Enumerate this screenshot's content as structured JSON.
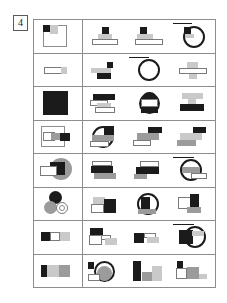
{
  "page": {
    "item_number": "4",
    "background_color": "#ffffff",
    "border_color": "#8d8d8d"
  },
  "palette": {
    "black": "#1b1b1b",
    "gray": "#9b9b9b",
    "light_gray": "#c9c9c9",
    "white": "#ffffff",
    "outline": "#7a7a7a"
  },
  "grid": {
    "rows": 8,
    "problem_column_count": 1,
    "option_column_count": 3,
    "rows_data": [
      {
        "index": 1,
        "problem": {
          "name": "large-outlined-square-with-black-and-gray-squares",
          "shapes": [
            "outline-square",
            "black-square",
            "light-gray-square"
          ]
        },
        "options": [
          {
            "index": 1,
            "name": "black-square-on-gray-trapezoid-on-white-bar",
            "shapes": [
              "black-square",
              "gray-trapezoid",
              "white-bar"
            ]
          },
          {
            "index": 2,
            "name": "black-square-on-gray-bar-over-white-bar",
            "shapes": [
              "black-square",
              "gray-bar",
              "white-bar"
            ]
          },
          {
            "index": 3,
            "name": "circle-with-black-square-and-horizontal-divider",
            "shapes": [
              "circle-outline",
              "black-square",
              "gray-bar",
              "horizontal-line"
            ]
          }
        ]
      },
      {
        "index": 2,
        "problem": {
          "name": "thin-white-bar-with-gray-end",
          "shapes": [
            "white-bar",
            "light-gray-square"
          ]
        },
        "options": [
          {
            "index": 1,
            "name": "gray-bar-with-black-square-over-black-bar",
            "shapes": [
              "gray-bar",
              "black-square",
              "black-bar"
            ]
          },
          {
            "index": 2,
            "name": "circle-with-horizontal-divider",
            "shapes": [
              "circle-outline",
              "horizontal-line"
            ]
          },
          {
            "index": 3,
            "name": "gray-cross-over-white-bar",
            "shapes": [
              "gray-bar",
              "white-bar",
              "gray-vertical-bar"
            ]
          }
        ]
      },
      {
        "index": 3,
        "problem": {
          "name": "solid-black-square",
          "shapes": [
            "black-square"
          ]
        },
        "options": [
          {
            "index": 1,
            "name": "black-bar-over-white-bars-staircase",
            "shapes": [
              "black-bar",
              "white-bar",
              "light-gray-bar",
              "white-bar"
            ]
          },
          {
            "index": 2,
            "name": "circle-with-black-cap-and-black-base",
            "shapes": [
              "circle-outline",
              "black-cap",
              "white-band",
              "black-base"
            ]
          },
          {
            "index": 3,
            "name": "light-gray-bar-over-black-bar-stack",
            "shapes": [
              "light-gray-bar",
              "gray-vertical-bar",
              "black-bar"
            ]
          }
        ]
      },
      {
        "index": 4,
        "problem": {
          "name": "overlapping-outline-gray-and-black-rectangles",
          "shapes": [
            "outline-square",
            "white-bar",
            "gray-bar",
            "black-bar"
          ]
        },
        "options": [
          {
            "index": 1,
            "name": "circle-with-black-corner-gray-band-and-white-bar",
            "shapes": [
              "circle-outline",
              "black-square",
              "gray-bar",
              "white-bar"
            ]
          },
          {
            "index": 2,
            "name": "black-gray-white-bar-staircase-right",
            "shapes": [
              "black-bar",
              "gray-bar",
              "white-bar"
            ]
          },
          {
            "index": 3,
            "name": "black-gray-white-bar-staircase-left",
            "shapes": [
              "black-bar",
              "light-gray-bar",
              "gray-bar"
            ]
          }
        ]
      },
      {
        "index": 5,
        "problem": {
          "name": "gray-circle-with-black-bar-and-white-rectangle",
          "shapes": [
            "gray-circle",
            "black-bar",
            "white-rectangle"
          ]
        },
        "options": [
          {
            "index": 1,
            "name": "white-bar-over-black-bar-over-gray-bar",
            "shapes": [
              "white-bar",
              "black-bar",
              "gray-bar"
            ]
          },
          {
            "index": 2,
            "name": "white-bar-over-black-bar-with-gray-step",
            "shapes": [
              "white-bar",
              "black-bar",
              "gray-bar"
            ]
          },
          {
            "index": 3,
            "name": "circle-with-gray-band-and-white-bar",
            "shapes": [
              "circle-outline",
              "gray-bar",
              "white-bar",
              "horizontal-line"
            ]
          }
        ]
      },
      {
        "index": 6,
        "problem": {
          "name": "three-overlapping-circles-black-gray-white",
          "shapes": [
            "black-circle",
            "gray-circle",
            "white-circle-outline"
          ]
        },
        "options": [
          {
            "index": 1,
            "name": "gray-white-and-black-square-cluster",
            "shapes": [
              "light-gray-square",
              "white-square",
              "black-square"
            ]
          },
          {
            "index": 2,
            "name": "circle-with-black-quadrant-and-gray-base",
            "shapes": [
              "circle-outline",
              "black-quadrant",
              "gray-bar"
            ]
          },
          {
            "index": 3,
            "name": "white-block-with-black-L-and-gray-base",
            "shapes": [
              "white-square",
              "black-block",
              "gray-bar"
            ]
          }
        ]
      },
      {
        "index": 7,
        "problem": {
          "name": "black-white-gray-square-row",
          "shapes": [
            "black-square",
            "white-square",
            "light-gray-square"
          ]
        },
        "options": [
          {
            "index": 1,
            "name": "black-bar-over-white-and-gray-bars",
            "shapes": [
              "black-bar",
              "white-bar",
              "light-gray-bar"
            ]
          },
          {
            "index": 2,
            "name": "black-square-with-white-and-gray-bars",
            "shapes": [
              "black-square",
              "white-bar",
              "light-gray-bar"
            ]
          },
          {
            "index": 3,
            "name": "circle-with-black-square-and-gray-band",
            "shapes": [
              "circle-outline",
              "black-square",
              "light-gray-bar",
              "horizontal-line"
            ]
          }
        ]
      },
      {
        "index": 8,
        "problem": {
          "name": "black-bar-with-light-gray-and-gray-blocks",
          "shapes": [
            "black-bar",
            "light-gray-bar",
            "gray-bar"
          ]
        },
        "options": [
          {
            "index": 1,
            "name": "small-black-square-beside-gray-filled-circle",
            "shapes": [
              "black-square",
              "circle-outline",
              "gray-fill",
              "white-bar"
            ]
          },
          {
            "index": 2,
            "name": "vertical-black-bar-with-gray-and-light-gray-blocks",
            "shapes": [
              "black-vertical-bar",
              "gray-square",
              "light-gray-square"
            ]
          },
          {
            "index": 3,
            "name": "black-square-over-white-and-gray-blocks",
            "shapes": [
              "black-square",
              "white-square",
              "gray-square",
              "light-gray-bar"
            ]
          }
        ]
      }
    ]
  }
}
